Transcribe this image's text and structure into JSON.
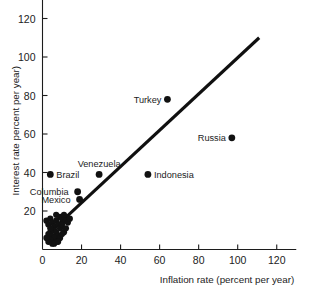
{
  "chart_data": {
    "type": "scatter",
    "title": "",
    "xlabel": "Inflation rate (percent per year)",
    "ylabel": "Interest rate percent per year)",
    "xlim": [
      0,
      130
    ],
    "ylim": [
      0,
      130
    ],
    "xticks": [
      0,
      20,
      40,
      60,
      80,
      100,
      120
    ],
    "yticks": [
      20,
      40,
      60,
      80,
      100,
      120
    ],
    "grid": false,
    "legend": null,
    "trend_line": {
      "label": "45-degree reference line",
      "x": [
        7,
        111
      ],
      "y": [
        12,
        110
      ]
    },
    "labeled_points": [
      {
        "name": "Turkey",
        "x": 64,
        "y": 78,
        "label_side": "left"
      },
      {
        "name": "Russia",
        "x": 97,
        "y": 58,
        "label_side": "left"
      },
      {
        "name": "Indonesia",
        "x": 54,
        "y": 39,
        "label_side": "right"
      },
      {
        "name": "Venezuela",
        "x": 29,
        "y": 39,
        "label_side": "above"
      },
      {
        "name": "Brazil",
        "x": 4,
        "y": 39,
        "label_side": "right"
      },
      {
        "name": "Columbia",
        "x": 18,
        "y": 30,
        "label_side": "left-far"
      },
      {
        "name": "Mexico",
        "x": 19,
        "y": 26,
        "label_side": "left-far"
      }
    ],
    "unlabeled_points": [
      {
        "x": 2,
        "y": 15
      },
      {
        "x": 4,
        "y": 16
      },
      {
        "x": 3,
        "y": 13
      },
      {
        "x": 5,
        "y": 14
      },
      {
        "x": 6,
        "y": 12
      },
      {
        "x": 7,
        "y": 15
      },
      {
        "x": 9,
        "y": 17
      },
      {
        "x": 10,
        "y": 16
      },
      {
        "x": 11,
        "y": 18
      },
      {
        "x": 8,
        "y": 13
      },
      {
        "x": 6,
        "y": 10
      },
      {
        "x": 4,
        "y": 9
      },
      {
        "x": 3,
        "y": 8
      },
      {
        "x": 5,
        "y": 7
      },
      {
        "x": 7,
        "y": 9
      },
      {
        "x": 9,
        "y": 11
      },
      {
        "x": 10,
        "y": 13
      },
      {
        "x": 12,
        "y": 15
      },
      {
        "x": 8,
        "y": 7
      },
      {
        "x": 6,
        "y": 6
      },
      {
        "x": 4,
        "y": 5
      },
      {
        "x": 3,
        "y": 4
      },
      {
        "x": 5,
        "y": 3
      },
      {
        "x": 7,
        "y": 4
      },
      {
        "x": 9,
        "y": 6
      },
      {
        "x": 11,
        "y": 9
      },
      {
        "x": 12,
        "y": 11
      },
      {
        "x": 13,
        "y": 14
      },
      {
        "x": 2,
        "y": 6
      },
      {
        "x": 6,
        "y": 3
      },
      {
        "x": 8,
        "y": 4
      },
      {
        "x": 10,
        "y": 8
      },
      {
        "x": 4,
        "y": 11
      },
      {
        "x": 7,
        "y": 18
      },
      {
        "x": 14,
        "y": 16
      }
    ]
  },
  "axis": {
    "x_title": "Inflation rate (percent per year)",
    "y_title": "Interest rate percent per year)"
  }
}
